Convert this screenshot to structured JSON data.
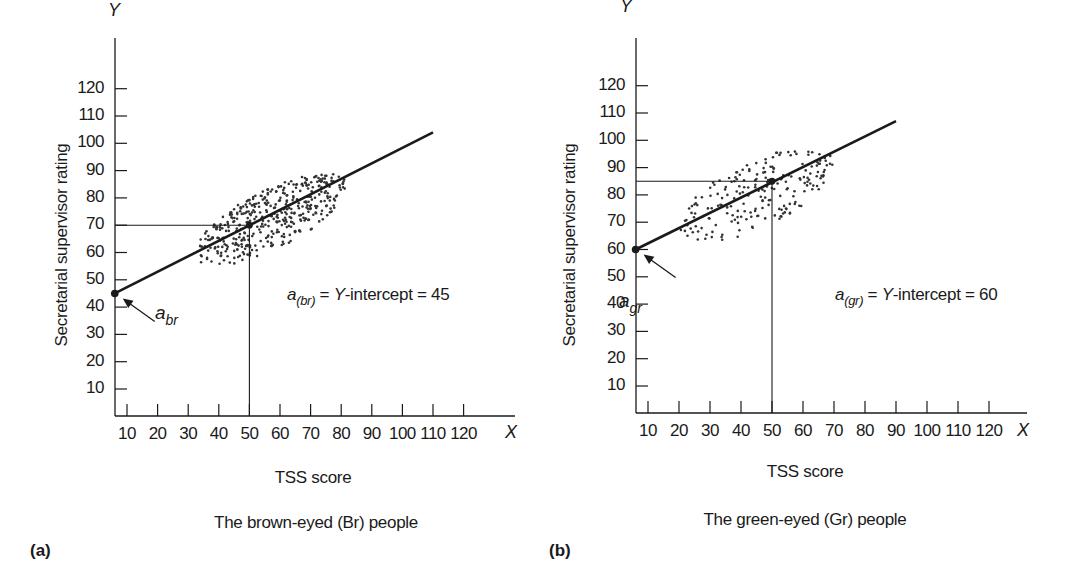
{
  "chart_data": [
    {
      "type": "scatter",
      "panel_tag": "(a)",
      "subtitle": "The brown-eyed (Br) people",
      "xlabel": "TSS score",
      "ylabel": "Secretarial supervisor rating",
      "x_axis_letter": "X",
      "y_axis_letter": "Y",
      "x_ticks": [
        10,
        20,
        30,
        40,
        50,
        60,
        70,
        80,
        90,
        100,
        110,
        120
      ],
      "y_ticks": [
        10,
        20,
        30,
        40,
        50,
        60,
        70,
        80,
        90,
        100,
        110,
        120
      ],
      "xlim": [
        6,
        132
      ],
      "ylim": [
        0,
        130
      ],
      "grid": false,
      "regression_line": {
        "x_start": 6,
        "y_start": 45,
        "x_end": 110,
        "y_end": 104
      },
      "intercept_point": {
        "x": 6,
        "y": 45,
        "label": "a",
        "label_sub": "br"
      },
      "reference_point": {
        "x": 50,
        "y": 70
      },
      "scatter_cloud": {
        "center_x": 57,
        "center_y": 72,
        "x_range": [
          30,
          85
        ],
        "y_range": [
          53,
          92
        ],
        "density": "dense"
      },
      "annotation": {
        "prefix": "a",
        "sub": "(br)",
        "eq1": " = ",
        "italic_y": "Y",
        "rest": "-intercept = 45"
      },
      "intercept_value": 45
    },
    {
      "type": "scatter",
      "panel_tag": "(b)",
      "subtitle": "The green-eyed (Gr) people",
      "xlabel": "TSS score",
      "ylabel": "Secretarial supervisor rating",
      "x_axis_letter": "X",
      "y_axis_letter": "Y",
      "x_ticks": [
        10,
        20,
        30,
        40,
        50,
        60,
        70,
        80,
        90,
        100,
        110,
        120
      ],
      "y_ticks": [
        10,
        20,
        30,
        40,
        50,
        60,
        70,
        80,
        90,
        100,
        110,
        120
      ],
      "xlim": [
        6,
        132
      ],
      "ylim": [
        0,
        130
      ],
      "grid": false,
      "regression_line": {
        "x_start": 6,
        "y_start": 60,
        "x_end": 90,
        "y_end": 107
      },
      "intercept_point": {
        "x": 6,
        "y": 60,
        "label": "a",
        "label_sub": "gr"
      },
      "reference_point": {
        "x": 50,
        "y": 85
      },
      "scatter_cloud": {
        "center_x": 45,
        "center_y": 80,
        "x_range": [
          18,
          72
        ],
        "y_range": [
          58,
          102
        ],
        "density": "sparse"
      },
      "annotation": {
        "prefix": "a",
        "sub": "(gr)",
        "eq1": " = ",
        "italic_y": "Y",
        "rest": "-intercept = 60"
      },
      "intercept_value": 60
    }
  ],
  "colors": {
    "ink": "#1a1a1a",
    "dots": "#333333",
    "background": "#ffffff"
  }
}
